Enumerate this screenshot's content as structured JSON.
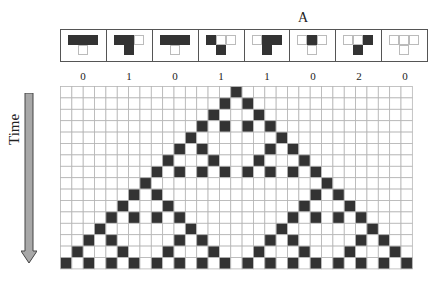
{
  "annotation": "A",
  "axis_label": "Time",
  "colors": {
    "on": "#333333",
    "off": "#ffffff",
    "gridline": "#b5b5b5",
    "arrow_fill": "#a8a8a8"
  },
  "rules": [
    {
      "pattern": [
        1,
        1,
        1
      ],
      "result": 0,
      "label": "0"
    },
    {
      "pattern": [
        1,
        1,
        0
      ],
      "result": 1,
      "label": "1"
    },
    {
      "pattern": [
        1,
        1,
        1
      ],
      "result": 0,
      "label": "0"
    },
    {
      "pattern": [
        1,
        0,
        0
      ],
      "result": 1,
      "label": "1"
    },
    {
      "pattern": [
        0,
        1,
        1
      ],
      "result": 1,
      "label": "1"
    },
    {
      "pattern": [
        0,
        1,
        0
      ],
      "result": 0,
      "label": "0"
    },
    {
      "pattern": [
        0,
        0,
        1
      ],
      "result": 1,
      "label": "2"
    },
    {
      "pattern": [
        0,
        0,
        0
      ],
      "result": 0,
      "label": "0"
    }
  ],
  "grid": {
    "columns": 31,
    "rows": [
      [
        15
      ],
      [
        14,
        16
      ],
      [
        13,
        17
      ],
      [
        12,
        14,
        16,
        18
      ],
      [
        11,
        19
      ],
      [
        10,
        12,
        18,
        20
      ],
      [
        9,
        13,
        17,
        21
      ],
      [
        8,
        10,
        12,
        14,
        16,
        18,
        20,
        22
      ],
      [
        7,
        23
      ],
      [
        6,
        8,
        22,
        24
      ],
      [
        5,
        9,
        21,
        25
      ],
      [
        4,
        6,
        8,
        10,
        20,
        22,
        24,
        26
      ],
      [
        3,
        11,
        19,
        27
      ],
      [
        2,
        4,
        10,
        12,
        18,
        20,
        26,
        28
      ],
      [
        1,
        5,
        9,
        13,
        17,
        21,
        25,
        29
      ],
      [
        0,
        2,
        4,
        6,
        8,
        10,
        12,
        14,
        16,
        18,
        20,
        22,
        24,
        26,
        28,
        30
      ]
    ]
  }
}
